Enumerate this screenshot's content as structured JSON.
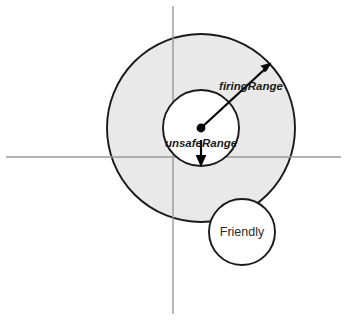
{
  "diagram": {
    "background_color": "#ffffff",
    "canvas": {
      "width": 347,
      "height": 320
    }
  },
  "axes": {
    "color": "#9a9a9a",
    "vertical": {
      "x": 173,
      "y1": 6,
      "y2": 314
    },
    "horizontal": {
      "y": 157,
      "x1": 6,
      "x2": 341
    }
  },
  "shapes": {
    "firing_range_circle": {
      "label": "firingRange",
      "cx": 201,
      "cy": 128,
      "r": 94,
      "fill": "#e9e9e9",
      "stroke": "#1a1a1a"
    },
    "unsafe_range_circle": {
      "label": "unsafeRange",
      "cx": 201,
      "cy": 128,
      "r": 38,
      "fill": "#ffffff",
      "stroke": "#1a1a1a"
    },
    "friendly_circle": {
      "label": "Friendly",
      "cx": 242,
      "cy": 232,
      "r": 33,
      "fill": "#ffffff",
      "stroke": "#1a1a1a"
    },
    "center_dot": {
      "cx": 201,
      "cy": 128,
      "r": 4.4,
      "fill": "#000000"
    }
  },
  "arrows": {
    "firing_range_arrow": {
      "from_x": 201,
      "from_y": 128,
      "to_x": 270,
      "to_y": 64,
      "color": "#000000"
    },
    "unsafe_range_arrow": {
      "from_x": 201,
      "from_y": 140,
      "to_x": 201,
      "to_y": 166,
      "color": "#000000"
    }
  },
  "labels": {
    "firing_range": {
      "text": "firingRange",
      "x": 251,
      "y": 90,
      "anchor": "middle",
      "style": "italic"
    },
    "unsafe_range": {
      "text": "unsafeRange",
      "x": 201,
      "y": 147,
      "anchor": "middle",
      "style": "italic"
    },
    "friendly": {
      "text": "Friendly",
      "x": 242,
      "y": 236,
      "anchor": "middle",
      "style": "plain"
    }
  }
}
